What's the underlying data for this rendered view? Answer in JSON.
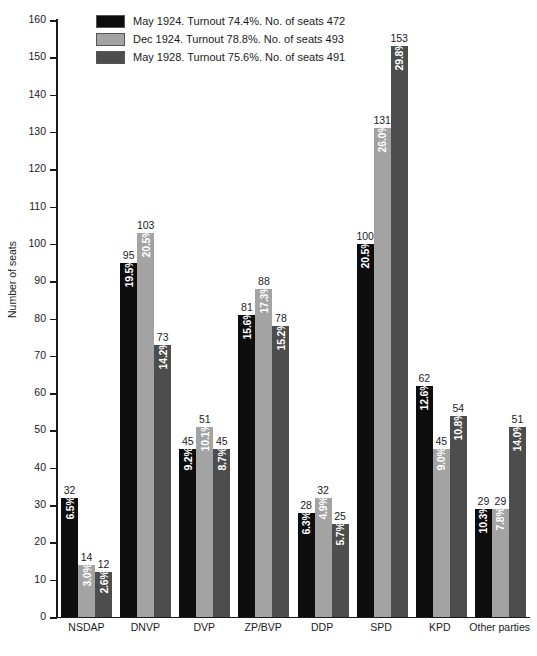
{
  "chart_data": {
    "type": "bar",
    "title": "",
    "xlabel": "",
    "ylabel": "Number of seats",
    "ylim": [
      0,
      160
    ],
    "ytick_step": 10,
    "yticks": [
      0,
      10,
      20,
      30,
      40,
      50,
      60,
      70,
      80,
      90,
      100,
      110,
      120,
      130,
      140,
      150,
      160
    ],
    "grid": false,
    "legend_position": "top-left-inside",
    "categories": [
      "NSDAP",
      "DNVP",
      "DVP",
      "ZP/BVP",
      "DDP",
      "SPD",
      "KPD",
      "Other parties"
    ],
    "series": [
      {
        "name": "May 1924. Turnout 74.4%. No. of seats 472",
        "short_name": "May 1924",
        "turnout": "74.4%",
        "total_seats": 472,
        "color": "#0d0d0d",
        "values": [
          32,
          95,
          45,
          81,
          28,
          100,
          62,
          29
        ],
        "percent_labels": [
          "6.5%",
          "19.5%",
          "9.2%",
          "15.6%",
          "6.3%",
          "20.5%",
          "12.6%",
          "10.3%"
        ]
      },
      {
        "name": "Dec 1924. Turnout 78.8%. No. of seats 493",
        "short_name": "Dec 1924",
        "turnout": "78.8%",
        "total_seats": 493,
        "color": "#a3a3a3",
        "values": [
          14,
          103,
          51,
          88,
          32,
          131,
          45,
          29
        ],
        "percent_labels": [
          "3.0%",
          "20.5%",
          "10.1%",
          "17.3%",
          "4.9%",
          "26.0%",
          "9.0%",
          "7.8%"
        ]
      },
      {
        "name": "May 1928. Turnout 75.6%. No. of seats 491",
        "short_name": "May 1928",
        "turnout": "75.6%",
        "total_seats": 491,
        "color": "#4d4d4d",
        "values": [
          12,
          73,
          45,
          78,
          25,
          153,
          54,
          51
        ],
        "percent_labels": [
          "2.6%",
          "14.2%",
          "8.7%",
          "15.2%",
          "5.7%",
          "29.8%",
          "10.8%",
          "14.0%"
        ]
      }
    ]
  }
}
